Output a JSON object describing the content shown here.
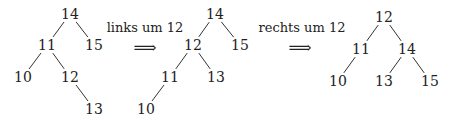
{
  "diagram": {
    "trees": [
      {
        "name": "before",
        "nodes": [
          {
            "id": "14",
            "label": "14",
            "x": 70,
            "y": 14
          },
          {
            "id": "11",
            "label": "11",
            "x": 47,
            "y": 45
          },
          {
            "id": "15",
            "label": "15",
            "x": 94,
            "y": 45
          },
          {
            "id": "10",
            "label": "10",
            "x": 23,
            "y": 77
          },
          {
            "id": "12",
            "label": "12",
            "x": 70,
            "y": 77
          },
          {
            "id": "13",
            "label": "13",
            "x": 94,
            "y": 109
          }
        ],
        "edges": [
          [
            "14",
            "11"
          ],
          [
            "14",
            "15"
          ],
          [
            "11",
            "10"
          ],
          [
            "11",
            "12"
          ],
          [
            "12",
            "13"
          ]
        ]
      },
      {
        "name": "after-left-rotation",
        "nodes": [
          {
            "id": "14",
            "label": "14",
            "x": 215,
            "y": 14
          },
          {
            "id": "12",
            "label": "12",
            "x": 193,
            "y": 45
          },
          {
            "id": "15",
            "label": "15",
            "x": 240,
            "y": 45
          },
          {
            "id": "11",
            "label": "11",
            "x": 170,
            "y": 77
          },
          {
            "id": "13",
            "label": "13",
            "x": 216,
            "y": 77
          },
          {
            "id": "10",
            "label": "10",
            "x": 146,
            "y": 109
          }
        ],
        "edges": [
          [
            "14",
            "12"
          ],
          [
            "14",
            "15"
          ],
          [
            "12",
            "11"
          ],
          [
            "12",
            "13"
          ],
          [
            "11",
            "10"
          ]
        ]
      },
      {
        "name": "after-right-rotation",
        "nodes": [
          {
            "id": "12",
            "label": "12",
            "x": 384,
            "y": 17
          },
          {
            "id": "11",
            "label": "11",
            "x": 361,
            "y": 49
          },
          {
            "id": "14",
            "label": "14",
            "x": 407,
            "y": 49
          },
          {
            "id": "10",
            "label": "10",
            "x": 338,
            "y": 81
          },
          {
            "id": "13",
            "label": "13",
            "x": 384,
            "y": 81
          },
          {
            "id": "15",
            "label": "15",
            "x": 430,
            "y": 81
          }
        ],
        "edges": [
          [
            "12",
            "11"
          ],
          [
            "12",
            "14"
          ],
          [
            "11",
            "10"
          ],
          [
            "14",
            "13"
          ],
          [
            "14",
            "15"
          ]
        ]
      }
    ],
    "transitions": [
      {
        "label": "links um 12",
        "arrow": "⟹",
        "label_x": 145,
        "label_y": 27,
        "arrow_x": 145,
        "arrow_y": 47
      },
      {
        "label": "rechts um 12",
        "arrow": "⟹",
        "label_x": 302,
        "label_y": 27,
        "arrow_x": 300,
        "arrow_y": 47
      }
    ]
  }
}
